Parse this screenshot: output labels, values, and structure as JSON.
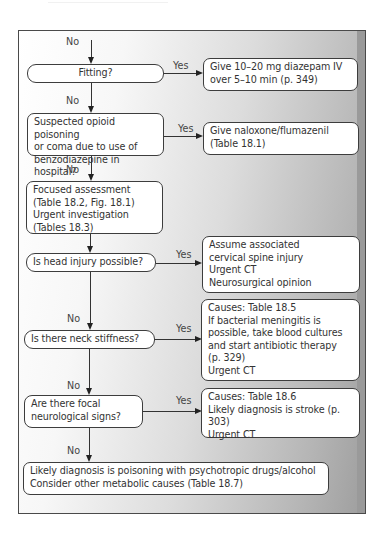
{
  "diagram": {
    "type": "flowchart",
    "branch_labels": {
      "no": "No",
      "yes": "Yes"
    },
    "nodes": {
      "fitting": "Fitting?",
      "diazepam": "Give 10–20 mg diazepam IV\nover 5–10 min (p. 349)",
      "opioid": "Suspected opioid poisoning\nor coma due to use of\nbenzodiazepine in hospital?",
      "naloxone": "Give naloxone/flumazenil\n(Table 18.1)",
      "assessment": "Focused assessment\n(Table 18.2, Fig. 18.1)\nUrgent investigation\n(Tables 18.3)",
      "head_injury": "Is head injury possible?",
      "head_injury_action": "Assume associated\ncervical spine injury\nUrgent CT\nNeurosurgical opinion",
      "neck_stiffness": "Is there neck stiffness?",
      "neck_stiffness_action": "Causes: Table 18.5\nIf bacterial meningitis is\npossible, take blood cultures\nand start antibiotic therapy\n(p. 329)\nUrgent CT",
      "focal_signs": "Are there focal\nneurological signs?",
      "focal_signs_action": "Causes: Table 18.6\nLikely diagnosis is stroke (p. 303)\nUrgent CT",
      "final": "Likely diagnosis is poisoning with psychotropic drugs/alcohol\nConsider other metabolic causes (Table 18.7)"
    },
    "edges": [
      {
        "from": "entry",
        "to": "fitting",
        "label": "No"
      },
      {
        "from": "fitting",
        "to": "diazepam",
        "label": "Yes"
      },
      {
        "from": "fitting",
        "to": "opioid",
        "label": "No"
      },
      {
        "from": "opioid",
        "to": "naloxone",
        "label": "Yes"
      },
      {
        "from": "opioid",
        "to": "assessment",
        "label": "No"
      },
      {
        "from": "assessment",
        "to": "head_injury",
        "label": ""
      },
      {
        "from": "head_injury",
        "to": "head_injury_action",
        "label": "Yes"
      },
      {
        "from": "head_injury",
        "to": "neck_stiffness",
        "label": "No"
      },
      {
        "from": "neck_stiffness",
        "to": "neck_stiffness_action",
        "label": "Yes"
      },
      {
        "from": "neck_stiffness",
        "to": "focal_signs",
        "label": "No"
      },
      {
        "from": "focal_signs",
        "to": "focal_signs_action",
        "label": "Yes"
      },
      {
        "from": "focal_signs",
        "to": "final",
        "label": "No"
      }
    ]
  }
}
